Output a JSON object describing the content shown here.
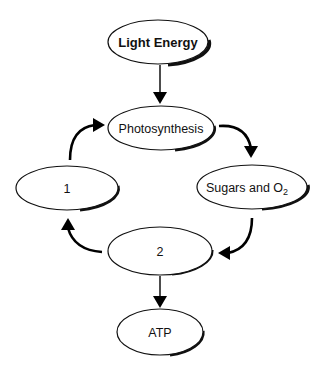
{
  "diagram": {
    "type": "flow-cycle",
    "nodes": {
      "light_energy": {
        "label": "Light Energy",
        "bold": true
      },
      "photosynthesis": {
        "label": "Photosynthesis"
      },
      "sugars": {
        "label": "Sugars and O",
        "subscript": "2"
      },
      "one": {
        "label": "1"
      },
      "two": {
        "label": "2"
      },
      "atp": {
        "label": "ATP"
      }
    },
    "edges": [
      {
        "from": "Light Energy",
        "to": "Photosynthesis"
      },
      {
        "from": "Photosynthesis",
        "to": "Sugars and O2"
      },
      {
        "from": "Sugars and O2",
        "to": "2"
      },
      {
        "from": "2",
        "to": "1"
      },
      {
        "from": "1",
        "to": "Photosynthesis"
      },
      {
        "from": "2",
        "to": "ATP"
      }
    ]
  }
}
